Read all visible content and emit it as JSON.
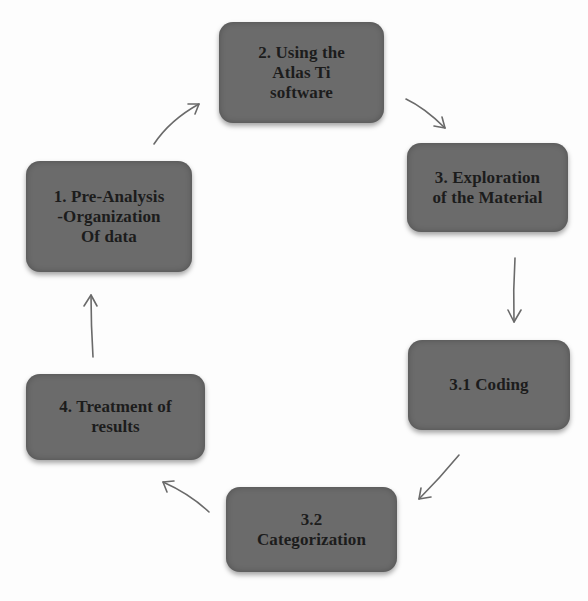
{
  "diagram": {
    "type": "cycle-flow",
    "node_color": "#6b6b6b",
    "text_color": "#1c1c1c",
    "arrow_color": "#6a6a6a",
    "nodes": [
      {
        "id": "n1",
        "label": "1. Pre-Analysis\n-Organization\nOf data"
      },
      {
        "id": "n2",
        "label": "2. Using the\nAtlas Ti\nsoftware"
      },
      {
        "id": "n3",
        "label": "3. Exploration\nof the Material"
      },
      {
        "id": "n31",
        "label": "3.1 Coding"
      },
      {
        "id": "n32",
        "label": "3.2\nCategorization"
      },
      {
        "id": "n4",
        "label": "4. Treatment of\nresults"
      }
    ],
    "edges": [
      {
        "from": "n1",
        "to": "n2"
      },
      {
        "from": "n2",
        "to": "n3"
      },
      {
        "from": "n3",
        "to": "n31"
      },
      {
        "from": "n31",
        "to": "n32"
      },
      {
        "from": "n32",
        "to": "n4"
      },
      {
        "from": "n4",
        "to": "n1"
      }
    ]
  }
}
